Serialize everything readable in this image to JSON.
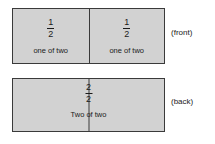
{
  "diagram": {
    "fill_color": "#d2d2d2",
    "stroke_color": "#3a3a3a",
    "text_color": "#1a1a1a",
    "front_bar": {
      "label": "(front)",
      "cells": [
        {
          "numerator": "1",
          "denominator": "2",
          "caption": "one of two"
        },
        {
          "numerator": "1",
          "denominator": "2",
          "caption": "one of two"
        }
      ]
    },
    "back_bar": {
      "label": "(back)",
      "numerator": "2",
      "denominator": "2",
      "caption": "Two of two"
    }
  }
}
